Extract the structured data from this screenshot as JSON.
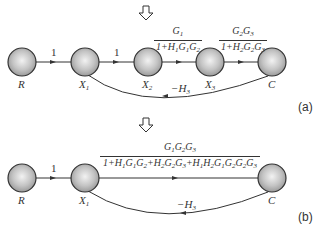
{
  "diagram_a": {
    "tag": "(a)",
    "nodes": [
      {
        "id": "R",
        "label": "R"
      },
      {
        "id": "X1",
        "label": "X",
        "sub": "1"
      },
      {
        "id": "X2",
        "label": "X",
        "sub": "2"
      },
      {
        "id": "X3",
        "label": "X",
        "sub": "3"
      },
      {
        "id": "C",
        "label": "C"
      }
    ],
    "edges": [
      {
        "from": "R",
        "to": "X1",
        "gain": "1"
      },
      {
        "from": "X1",
        "to": "X2",
        "gain": "1"
      },
      {
        "from": "X2",
        "to": "X3",
        "numerator": "G1",
        "denominator": "1+H1G1G2"
      },
      {
        "from": "X3",
        "to": "C",
        "numerator": "G2G3",
        "denominator": "1+H2G2G3"
      },
      {
        "from": "C",
        "to": "X1",
        "gain": "-H3"
      }
    ],
    "gain_1": "1",
    "gain_2": "1",
    "feedback": "−H",
    "feedback_sub": "3"
  },
  "diagram_b": {
    "tag": "(b)",
    "nodes": [
      {
        "id": "R",
        "label": "R"
      },
      {
        "id": "X1",
        "label": "X",
        "sub": "1"
      },
      {
        "id": "C",
        "label": "C"
      }
    ],
    "edges": [
      {
        "from": "R",
        "to": "X1",
        "gain": "1"
      },
      {
        "from": "X1",
        "to": "C",
        "numerator": "G1G2G3",
        "denominator": "1+H1G1G2+H2G2G3+H1H2G1G2G2G3"
      },
      {
        "from": "C",
        "to": "X1",
        "gain": "-H3"
      }
    ],
    "gain_1": "1",
    "feedback": "−H",
    "feedback_sub": "3"
  },
  "labels": {
    "R": "R",
    "X": "X",
    "C": "C",
    "sub1": "1",
    "sub2": "2",
    "sub3": "3"
  },
  "transition_arrow": "down-hollow-arrow"
}
